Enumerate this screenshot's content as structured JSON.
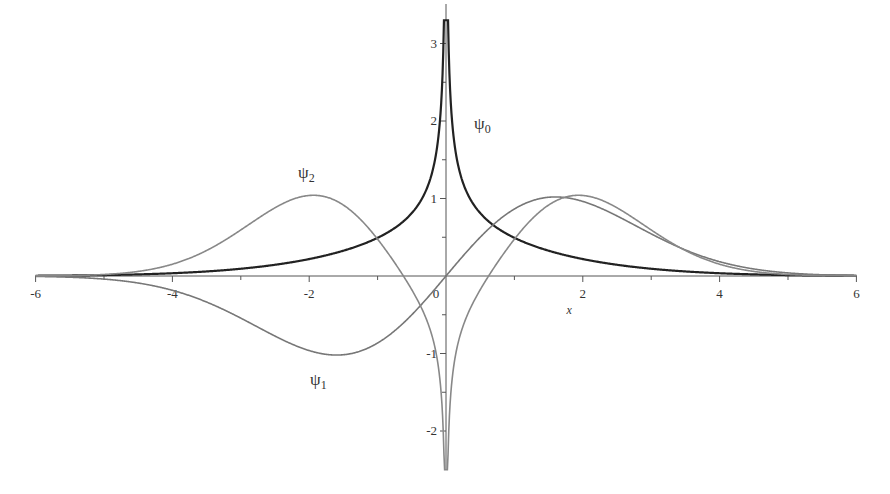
{
  "chart_data": {
    "type": "line",
    "title": "",
    "xlabel": "x",
    "ylabel": "",
    "xlim": [
      -6,
      6
    ],
    "ylim": [
      -2.5,
      3.3
    ],
    "grid": false,
    "legend": "none (inline curve labels)",
    "x_ticks": [
      -6,
      -4,
      -2,
      0,
      2,
      4,
      6
    ],
    "x_tick_labels": [
      "-6",
      "-4",
      "-2",
      "0",
      "2",
      "4",
      "6"
    ],
    "y_ticks": [
      -2,
      -1,
      1,
      2,
      3
    ],
    "y_tick_labels": [
      "-2",
      "-1",
      "1",
      "2",
      "3"
    ],
    "series": [
      {
        "name": "ψ0",
        "label": "ψ",
        "subscript": "0",
        "color": "#222222",
        "description": "even, cusp diverging at x=0, decays to 0",
        "x": [
          -6,
          -5,
          -4,
          -3,
          -2,
          -1.5,
          -1,
          -0.5,
          -0.2,
          -0.05,
          0.05,
          0.2,
          0.5,
          1,
          1.5,
          2,
          3,
          4,
          5,
          6
        ],
        "y": [
          0.0,
          0.01,
          0.03,
          0.1,
          0.25,
          0.38,
          0.55,
          0.9,
          1.5,
          3.2,
          3.2,
          1.5,
          0.9,
          0.55,
          0.38,
          0.25,
          0.1,
          0.03,
          0.01,
          0.0
        ]
      },
      {
        "name": "ψ1",
        "label": "ψ",
        "subscript": "1",
        "color": "#777777",
        "description": "odd, min ≈ -1 at x≈-1.6, max ≈ 1 at x≈1.6",
        "x": [
          -6,
          -5,
          -4,
          -3,
          -2,
          -1.6,
          -1,
          -0.5,
          0,
          0.5,
          1,
          1.6,
          2,
          3,
          4,
          5,
          6
        ],
        "y": [
          0.0,
          -0.02,
          -0.12,
          -0.5,
          -0.92,
          -0.98,
          -0.8,
          -0.42,
          0.0,
          0.42,
          0.8,
          0.98,
          0.92,
          0.5,
          0.12,
          0.02,
          0.0
        ]
      },
      {
        "name": "ψ2",
        "label": "ψ",
        "subscript": "2",
        "color": "#888888",
        "description": "even, maxima ≈ 1.07 at x≈±1.9, dips to -2.5 spike at x=0",
        "x": [
          -6,
          -5,
          -4,
          -3,
          -2,
          -1.9,
          -1.5,
          -1,
          -0.5,
          -0.2,
          -0.05,
          0.05,
          0.2,
          0.5,
          1,
          1.5,
          1.9,
          2,
          3,
          4,
          5,
          6
        ],
        "y": [
          0.0,
          0.03,
          0.2,
          0.65,
          1.06,
          1.07,
          0.95,
          0.55,
          -0.1,
          -0.7,
          -2.5,
          -2.5,
          -0.7,
          -0.1,
          0.55,
          0.95,
          1.07,
          1.06,
          0.65,
          0.2,
          0.03,
          0.0
        ]
      }
    ],
    "annotations": [
      {
        "text": "ψ0",
        "x": 0.5,
        "y": 2.1
      },
      {
        "text": "ψ1",
        "x": -1.9,
        "y": -1.35
      },
      {
        "text": "ψ2",
        "x": -2.1,
        "y": 1.3
      }
    ]
  },
  "labels": {
    "x_axis_title": "x",
    "origin": "0",
    "psi": "ψ",
    "sub0": "0",
    "sub1": "1",
    "sub2": "2"
  }
}
